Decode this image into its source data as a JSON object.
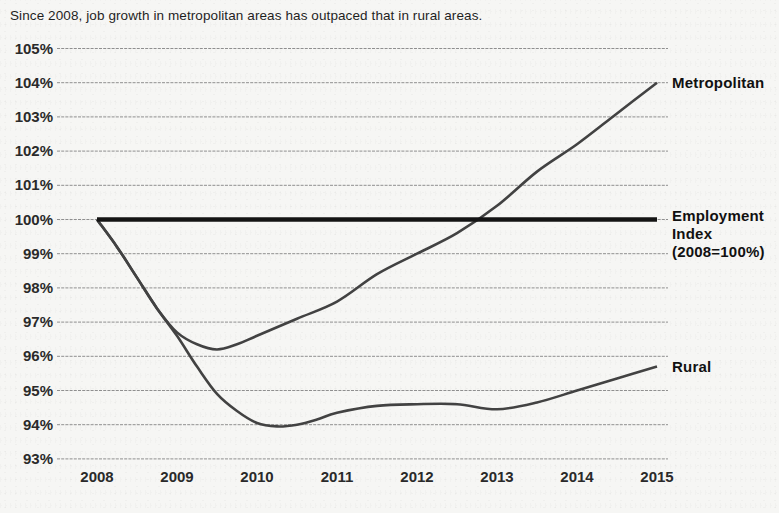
{
  "page": {
    "title": "Since 2008, job growth in metropolitan areas has outpaced that in rural areas."
  },
  "colors": {
    "background": "#f6f6f4",
    "title_text": "#1f1f1f",
    "tick_text": "#2a2a2a",
    "gridline": "#8f8f8f",
    "metro_rural_line": "#424242",
    "employment_line": "#141414",
    "series_label_text": "#111111"
  },
  "chart_data": {
    "type": "line",
    "title": "Since 2008, job growth in metropolitan areas has outpaced that in rural areas.",
    "xlabel": "",
    "ylabel": "",
    "x_ticks": [
      "2008",
      "2009",
      "2010",
      "2011",
      "2012",
      "2013",
      "2014",
      "2015"
    ],
    "y_ticks": [
      "105%",
      "104%",
      "103%",
      "102%",
      "101%",
      "100%",
      "99%",
      "98%",
      "97%",
      "96%",
      "95%",
      "94%",
      "93%"
    ],
    "xlim": [
      2007.5,
      2015.15
    ],
    "ylim": [
      93,
      105
    ],
    "grid": true,
    "legend_position": "labels at right ends of lines",
    "series": [
      {
        "name": "Metropolitan",
        "label_lines": [
          "Metropolitan"
        ],
        "color": "#424242",
        "stroke_width": 2.6,
        "smooth": true,
        "points": [
          [
            2008,
            100.0
          ],
          [
            2008.25,
            99.2
          ],
          [
            2008.5,
            98.3
          ],
          [
            2008.75,
            97.4
          ],
          [
            2009,
            96.7
          ],
          [
            2009.25,
            96.35
          ],
          [
            2009.5,
            96.2
          ],
          [
            2009.75,
            96.35
          ],
          [
            2010,
            96.6
          ],
          [
            2010.5,
            97.1
          ],
          [
            2011,
            97.6
          ],
          [
            2011.5,
            98.4
          ],
          [
            2012,
            99.0
          ],
          [
            2012.5,
            99.6
          ],
          [
            2013,
            100.4
          ],
          [
            2013.5,
            101.4
          ],
          [
            2014,
            102.2
          ],
          [
            2014.5,
            103.1
          ],
          [
            2015,
            104.0
          ]
        ]
      },
      {
        "name": "Employment Index (2008=100%)",
        "label_lines": [
          "Employment",
          "Index",
          "(2008=100%)"
        ],
        "color": "#141414",
        "stroke_width": 4.6,
        "smooth": false,
        "points": [
          [
            2008,
            100.0
          ],
          [
            2015,
            100.0
          ]
        ]
      },
      {
        "name": "Rural",
        "label_lines": [
          "Rural"
        ],
        "color": "#424242",
        "stroke_width": 2.6,
        "smooth": true,
        "points": [
          [
            2008,
            100.0
          ],
          [
            2008.25,
            99.2
          ],
          [
            2008.5,
            98.3
          ],
          [
            2008.75,
            97.4
          ],
          [
            2009,
            96.6
          ],
          [
            2009.25,
            95.7
          ],
          [
            2009.5,
            94.9
          ],
          [
            2009.75,
            94.4
          ],
          [
            2010,
            94.05
          ],
          [
            2010.25,
            93.95
          ],
          [
            2010.5,
            94.0
          ],
          [
            2010.75,
            94.15
          ],
          [
            2011,
            94.35
          ],
          [
            2011.5,
            94.55
          ],
          [
            2012,
            94.6
          ],
          [
            2012.5,
            94.6
          ],
          [
            2013,
            94.45
          ],
          [
            2013.5,
            94.65
          ],
          [
            2014,
            95.0
          ],
          [
            2014.5,
            95.35
          ],
          [
            2015,
            95.7
          ]
        ]
      }
    ]
  }
}
